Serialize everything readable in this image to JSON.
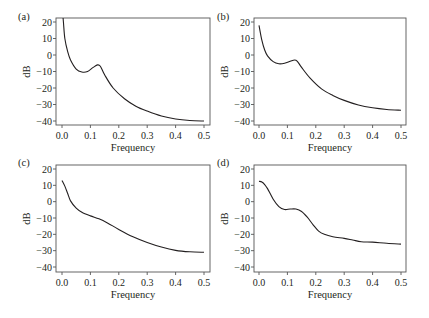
{
  "chart_data": [
    {
      "panel": "(a)",
      "type": "line",
      "xlabel": "Frequency",
      "ylabel": "dB",
      "xlim": [
        0.0,
        0.5
      ],
      "ylim": [
        -40,
        20
      ],
      "xticks": [
        "0.0",
        "0.1",
        "0.2",
        "0.3",
        "0.4",
        "0.5"
      ],
      "yticks": [
        "20",
        "10",
        "0",
        "−10",
        "−20",
        "−30",
        "−40"
      ],
      "x": [
        0.0,
        0.005,
        0.01,
        0.02,
        0.03,
        0.05,
        0.07,
        0.09,
        0.11,
        0.125,
        0.135,
        0.15,
        0.18,
        0.22,
        0.26,
        0.3,
        0.35,
        0.4,
        0.45,
        0.5
      ],
      "y": [
        30,
        20,
        10,
        2,
        -3,
        -8.5,
        -10.3,
        -10,
        -7.5,
        -6,
        -6.8,
        -12,
        -20,
        -26.5,
        -31,
        -34,
        -37,
        -38.8,
        -39.7,
        -40
      ]
    },
    {
      "panel": "(b)",
      "type": "line",
      "xlabel": "Frequency",
      "ylabel": "dB",
      "xlim": [
        0.0,
        0.5
      ],
      "ylim": [
        -40,
        20
      ],
      "xticks": [
        "0.0",
        "0.1",
        "0.2",
        "0.3",
        "0.4",
        "0.5"
      ],
      "yticks": [
        "20",
        "10",
        "0",
        "−10",
        "−20",
        "−30",
        "−40"
      ],
      "x": [
        0.0,
        0.01,
        0.02,
        0.03,
        0.05,
        0.07,
        0.09,
        0.11,
        0.125,
        0.135,
        0.15,
        0.18,
        0.22,
        0.26,
        0.3,
        0.35,
        0.4,
        0.45,
        0.5
      ],
      "y": [
        18,
        9,
        3,
        -0.5,
        -4,
        -5.3,
        -5,
        -3.8,
        -3,
        -3.8,
        -7.5,
        -14,
        -20.5,
        -24.5,
        -27.5,
        -30.3,
        -32,
        -33,
        -33.5
      ]
    },
    {
      "panel": "(c)",
      "type": "line",
      "xlabel": "Frequency",
      "ylabel": "dB",
      "xlim": [
        0.0,
        0.5
      ],
      "ylim": [
        -40,
        20
      ],
      "xticks": [
        "0.0",
        "0.1",
        "0.2",
        "0.3",
        "0.4",
        "0.5"
      ],
      "yticks": [
        "20",
        "10",
        "0",
        "−10",
        "−20",
        "−30",
        "−40"
      ],
      "x": [
        0.0,
        0.01,
        0.02,
        0.03,
        0.05,
        0.07,
        0.1,
        0.13,
        0.16,
        0.2,
        0.25,
        0.3,
        0.35,
        0.4,
        0.45,
        0.5
      ],
      "y": [
        13,
        9.5,
        5,
        0.5,
        -4,
        -6.5,
        -8.7,
        -10.5,
        -13,
        -17,
        -21.5,
        -25,
        -27.8,
        -29.8,
        -30.7,
        -31
      ]
    },
    {
      "panel": "(d)",
      "type": "line",
      "xlabel": "Frequency",
      "ylabel": "dB",
      "xlim": [
        0.0,
        0.5
      ],
      "ylim": [
        -40,
        20
      ],
      "xticks": [
        "0.0",
        "0.1",
        "0.2",
        "0.3",
        "0.4",
        "0.5"
      ],
      "yticks": [
        "20",
        "10",
        "0",
        "−10",
        "−20",
        "−30",
        "−40"
      ],
      "x": [
        0.0,
        0.01,
        0.02,
        0.03,
        0.05,
        0.07,
        0.09,
        0.11,
        0.13,
        0.15,
        0.17,
        0.19,
        0.21,
        0.23,
        0.26,
        0.3,
        0.33,
        0.36,
        0.4,
        0.45,
        0.5
      ],
      "y": [
        12.5,
        12,
        10.5,
        8,
        1.5,
        -3,
        -4.8,
        -4.5,
        -4.5,
        -6,
        -9.5,
        -14,
        -18,
        -20,
        -21.5,
        -22.5,
        -23.5,
        -24.5,
        -24.8,
        -25.5,
        -26
      ]
    }
  ]
}
